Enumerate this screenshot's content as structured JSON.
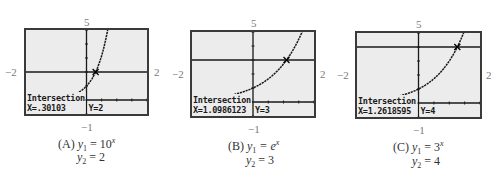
{
  "figure": {
    "window": {
      "xmin": -2,
      "xmax": 2,
      "ymin": -1,
      "ymax": 5
    },
    "axis_labels": {
      "top": "5",
      "left": "−2",
      "right": "2",
      "bottom": "−1"
    },
    "panels": [
      {
        "id": "A",
        "label": "(A)",
        "y1_lhs": "y",
        "y1_sub": "1",
        "y1_eq": " = 10",
        "y1_sup": "x",
        "y2_lhs": "y",
        "y2_sub": "2",
        "y2_eq": " = 2",
        "screen_title": "Intersection",
        "screen_x": "X=.30103",
        "screen_y": "Y=2",
        "base": 10,
        "y2_value": 2,
        "intersection_x": 0.30103
      },
      {
        "id": "B",
        "label": "(B)",
        "y1_lhs": "y",
        "y1_sub": "1",
        "y1_eq": " = e",
        "y1_sup": "x",
        "y2_lhs": "y",
        "y2_sub": "2",
        "y2_eq": " = 3",
        "screen_title": "Intersection",
        "screen_x": "X=1.0986123",
        "screen_y": "Y=3",
        "base": 2.718281828,
        "y2_value": 3,
        "intersection_x": 1.0986123
      },
      {
        "id": "C",
        "label": "(C)",
        "y1_lhs": "y",
        "y1_sub": "1",
        "y1_eq": " = 3",
        "y1_sup": "x",
        "y2_lhs": "y",
        "y2_sub": "2",
        "y2_eq": " = 4",
        "screen_title": "Intersection",
        "screen_x": "X=1.2618595",
        "screen_y": "Y=4",
        "base": 3,
        "y2_value": 4,
        "intersection_x": 1.2618595
      }
    ]
  }
}
